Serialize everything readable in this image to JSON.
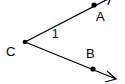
{
  "diagram": {
    "type": "angle",
    "vertex": {
      "label": "C",
      "x": 25,
      "y": 42
    },
    "points": [
      {
        "label": "A",
        "x": 94,
        "y": 5
      },
      {
        "label": "B",
        "x": 93,
        "y": 69
      }
    ],
    "angle_label": "1",
    "rays": [
      {
        "from": "C",
        "through": "A",
        "arrow": true
      },
      {
        "from": "C",
        "through": "B",
        "arrow": true
      }
    ],
    "colors": {
      "stroke": "#000000",
      "background": "#ffffff"
    }
  }
}
